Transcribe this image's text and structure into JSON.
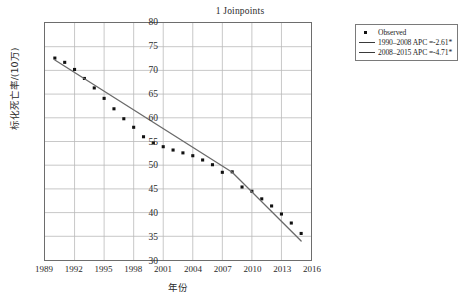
{
  "chart_data": {
    "type": "scatter",
    "title": "1 Joinpoints",
    "xlabel": "年份",
    "ylabel": "标化死亡率/(10万)",
    "xlim": [
      1989,
      2016
    ],
    "ylim": [
      30,
      80
    ],
    "xticks": [
      1989,
      1992,
      1995,
      1998,
      2001,
      2004,
      2007,
      2010,
      2013,
      2016
    ],
    "yticks": [
      30,
      35,
      40,
      45,
      50,
      55,
      60,
      65,
      70,
      75,
      80
    ],
    "grid": true,
    "legend_position": "right",
    "series": [
      {
        "name": "Observed",
        "type": "scatter",
        "marker": "square",
        "color": "#111111",
        "x": [
          1990,
          1991,
          1992,
          1993,
          1994,
          1995,
          1996,
          1997,
          1998,
          1999,
          2000,
          2001,
          2002,
          2003,
          2004,
          2005,
          2006,
          2007,
          2008,
          2009,
          2010,
          2011,
          2012,
          2013,
          2014,
          2015
        ],
        "values": [
          72.6,
          71.7,
          70.2,
          68.3,
          66.3,
          64.1,
          61.9,
          59.8,
          58.0,
          56.0,
          54.7,
          53.9,
          53.2,
          52.6,
          52.0,
          51.1,
          50.1,
          48.5,
          48.6,
          45.4,
          44.5,
          42.9,
          41.4,
          39.7,
          37.8,
          35.6
        ]
      },
      {
        "name": "1990–2008 APC =-2.61*",
        "type": "line",
        "color": "#6a6a6a",
        "segment_start_year": 1990,
        "segment_end_year": 2008,
        "start_value": 72.2,
        "end_value": 48.5,
        "apc": -2.61,
        "significant": true
      },
      {
        "name": "2008–2015 APC =-4.71*",
        "type": "line",
        "color": "#6a6a6a",
        "segment_start_year": 2008,
        "segment_end_year": 2015,
        "start_value": 48.5,
        "end_value": 34.0,
        "apc": -4.71,
        "significant": true
      }
    ],
    "legend_entries": [
      {
        "key": "marker",
        "label": "Observed"
      },
      {
        "key": "line",
        "label": "1990–2008 APC =-2.61*"
      },
      {
        "key": "line",
        "label": "2008–2015 APC =-4.71*"
      }
    ]
  }
}
